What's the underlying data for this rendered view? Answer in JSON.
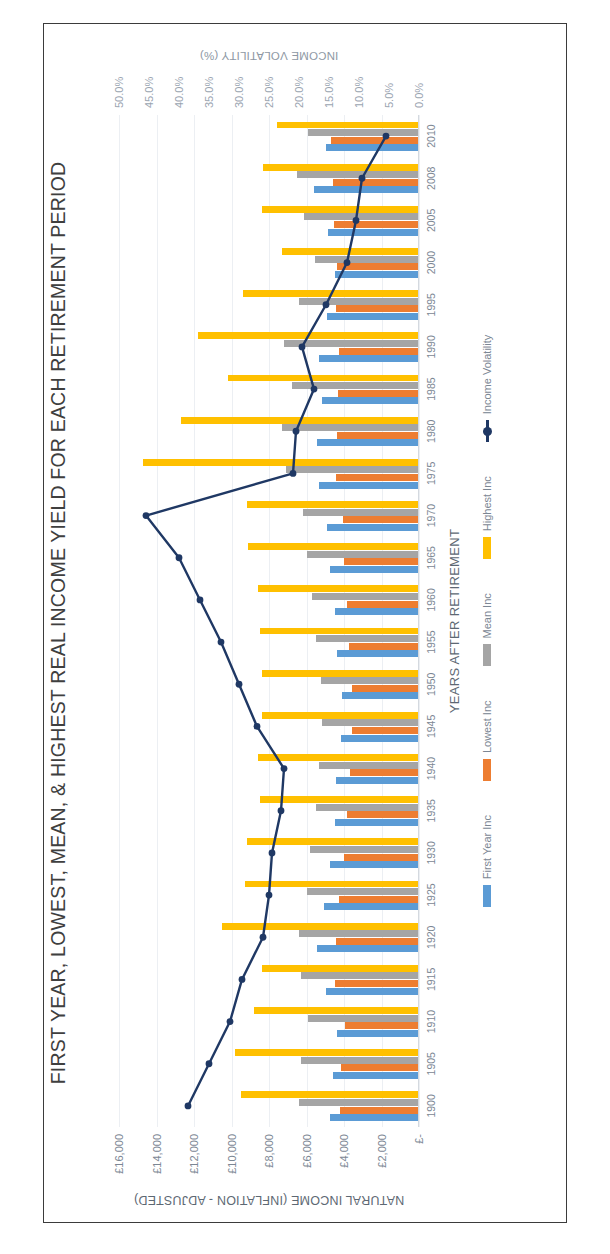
{
  "chart_data": {
    "type": "bar",
    "title": "FIRST YEAR, LOWEST, MEAN, & HIGHEST REAL INCOME YIELD FOR EACH RETIREMENT PERIOD",
    "xlabel": "YEARS AFTER RETIREMENT",
    "ylabel": "NATURAL INCOME (INFLATION - ADJUSTED)",
    "y2label": "INCOME VOLATILITY (%)",
    "grid": true,
    "legend_position": "bottom",
    "ylim": [
      0,
      16000
    ],
    "y2lim": [
      0,
      50
    ],
    "ytick_labels": [
      "£16,000",
      "£14,000",
      "£12,000",
      "£10,000",
      "£8,000",
      "£6,000",
      "£4,000",
      "£2,000",
      "£-"
    ],
    "ytick_values": [
      16000,
      14000,
      12000,
      10000,
      8000,
      6000,
      4000,
      2000,
      0
    ],
    "y2tick_labels": [
      "50.0%",
      "45.0%",
      "40.0%",
      "35.0%",
      "30.0%",
      "25.0%",
      "20.0%",
      "15.0%",
      "10.0%",
      "5.0%",
      "0.0%"
    ],
    "y2tick_values": [
      50,
      45,
      40,
      35,
      30,
      25,
      20,
      15,
      10,
      5,
      0
    ],
    "categories": [
      "1900",
      "1905",
      "1910",
      "1915",
      "1920",
      "1925",
      "1930",
      "1935",
      "1940",
      "1945",
      "1950",
      "1955",
      "1960",
      "1965",
      "1970",
      "1975",
      "1980",
      "1985",
      "1990",
      "1995",
      "2000",
      "2005",
      "2008",
      "2010"
    ],
    "series": [
      {
        "name": "First Year Inc",
        "color": "#5B9BD5",
        "kind": "bar",
        "values": [
          4750,
          4600,
          4350,
          4950,
          5450,
          5050,
          4750,
          4500,
          4450,
          4150,
          4100,
          4350,
          4500,
          4750,
          4900,
          5350,
          5450,
          5150,
          5350,
          4900,
          4500,
          4850,
          5600,
          4950
        ]
      },
      {
        "name": "Lowest Inc",
        "color": "#ED7D31",
        "kind": "bar",
        "values": [
          4200,
          4150,
          3950,
          4500,
          4450,
          4250,
          4000,
          3850,
          3700,
          3600,
          3550,
          3750,
          3850,
          4000,
          4050,
          4450,
          4350,
          4300,
          4250,
          4450,
          4350,
          4550,
          4600,
          4700
        ]
      },
      {
        "name": "Mean Inc",
        "color": "#A5A5A5",
        "kind": "bar",
        "values": [
          6400,
          6300,
          5900,
          6300,
          6400,
          5950,
          5800,
          5500,
          5350,
          5200,
          5250,
          5500,
          5700,
          6000,
          6200,
          7100,
          7300,
          6750,
          7200,
          6400,
          5550,
          6150,
          6500,
          5900
        ]
      },
      {
        "name": "Highest Inc",
        "color": "#FFC000",
        "kind": "bar",
        "values": [
          9500,
          9800,
          8800,
          8400,
          10500,
          9300,
          9200,
          8500,
          8600,
          8400,
          8350,
          8500,
          8600,
          9100,
          9200,
          14700,
          12700,
          10200,
          11800,
          9400,
          7300,
          8400,
          8300,
          7600
        ]
      },
      {
        "name": "Income Volatility",
        "color": "#1F3864",
        "kind": "line",
        "axis": "y2",
        "values": [
          38.5,
          35.0,
          31.5,
          29.5,
          26.0,
          25.0,
          24.5,
          23.0,
          22.5,
          27.0,
          30.0,
          33.0,
          36.5,
          40.0,
          45.5,
          21.0,
          20.5,
          17.5,
          19.5,
          15.5,
          12.0,
          10.5,
          9.5,
          5.5
        ]
      }
    ],
    "legend": [
      {
        "label": "First Year Inc",
        "color": "#5B9BD5",
        "kind": "bar"
      },
      {
        "label": "Lowest Inc",
        "color": "#ED7D31",
        "kind": "bar"
      },
      {
        "label": "Mean Inc",
        "color": "#A5A5A5",
        "kind": "bar"
      },
      {
        "label": "Highest Inc",
        "color": "#FFC000",
        "kind": "bar"
      },
      {
        "label": "Income Volatility",
        "color": "#1F3864",
        "kind": "line"
      }
    ]
  },
  "page": {
    "frame_color": "#3b3b3b",
    "background": "#ffffff"
  }
}
